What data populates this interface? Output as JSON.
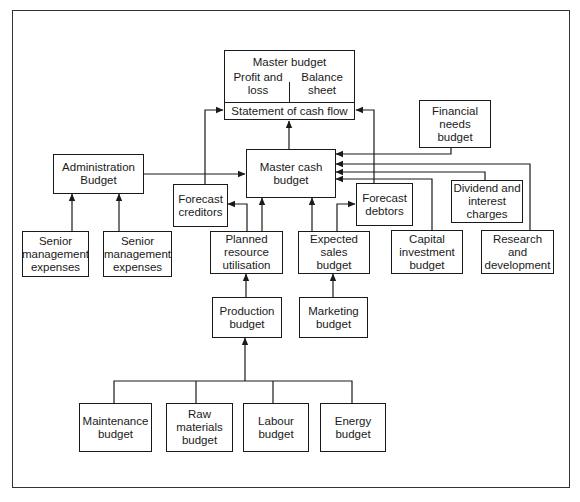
{
  "diagram": {
    "type": "budget-flow-diagram",
    "master_budget": {
      "title": "Master budget",
      "left_section": "Profit and\nloss",
      "right_section": "Balance\nsheet",
      "bottom_section": "Statement of cash flow"
    },
    "nodes": {
      "master_cash_budget": "Master cash\nbudget",
      "administration_budget": "Administration\nBudget",
      "forecast_creditors": "Forecast\ncreditors",
      "forecast_debtors": "Forecast\ndebtors",
      "financial_needs_budget": "Financial\nneeds\nbudget",
      "dividend_interest": "Dividend and\ninterest\ncharges",
      "senior_mgmt_1": "Senior\nmanagement\nexpenses",
      "senior_mgmt_2": "Senior\nmanagement\nexpenses",
      "planned_resource": "Planned\nresource\nutilisation",
      "expected_sales": "Expected\nsales\nbudget",
      "capital_investment": "Capital\ninvestment\nbudget",
      "research_development": "Research\nand\ndevelopment",
      "production_budget": "Production\nbudget",
      "marketing_budget": "Marketing\nbudget",
      "maintenance_budget": "Maintenance\nbudget",
      "raw_materials_budget": "Raw\nmaterials\nbudget",
      "labour_budget": "Labour\nbudget",
      "energy_budget": "Energy\nbudget"
    },
    "edges": [
      {
        "from": "master_cash_budget",
        "to": "master_budget.statement_of_cash_flow"
      },
      {
        "from": "forecast_creditors",
        "to": "master_budget.statement_of_cash_flow"
      },
      {
        "from": "forecast_debtors",
        "to": "master_budget.statement_of_cash_flow"
      },
      {
        "from": "administration_budget",
        "to": "master_cash_budget"
      },
      {
        "from": "financial_needs_budget",
        "to": "master_cash_budget"
      },
      {
        "from": "research_development",
        "to": "master_cash_budget"
      },
      {
        "from": "dividend_interest",
        "to": "master_cash_budget"
      },
      {
        "from": "capital_investment",
        "to": "master_cash_budget"
      },
      {
        "from": "planned_resource",
        "to": "master_cash_budget"
      },
      {
        "from": "planned_resource",
        "to": "forecast_creditors"
      },
      {
        "from": "expected_sales",
        "to": "master_cash_budget"
      },
      {
        "from": "expected_sales",
        "to": "forecast_debtors"
      },
      {
        "from": "senior_mgmt_1",
        "to": "administration_budget"
      },
      {
        "from": "senior_mgmt_2",
        "to": "administration_budget"
      },
      {
        "from": "production_budget",
        "to": "planned_resource"
      },
      {
        "from": "marketing_budget",
        "to": "expected_sales"
      },
      {
        "from": "maintenance_budget",
        "to": "production_budget"
      },
      {
        "from": "raw_materials_budget",
        "to": "production_budget"
      },
      {
        "from": "labour_budget",
        "to": "production_budget"
      },
      {
        "from": "energy_budget",
        "to": "production_budget"
      }
    ],
    "colors": {
      "line": "#1a1a1a",
      "background": "#ffffff",
      "frame": "#333333"
    }
  }
}
